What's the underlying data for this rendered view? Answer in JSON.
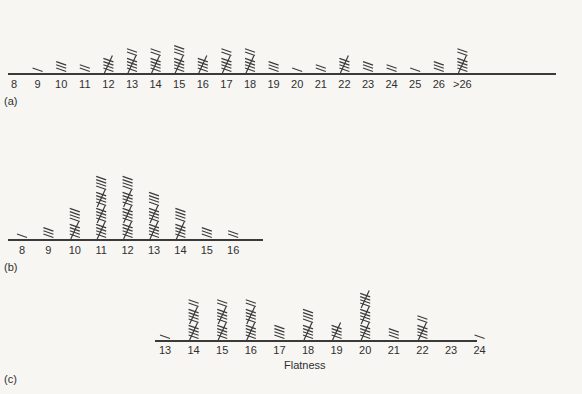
{
  "chart_data": [
    {
      "type": "bar",
      "style": "tally-marks",
      "panel_label": "(a)",
      "xlabel": "",
      "categories": [
        "8",
        "9",
        "10",
        "11",
        "12",
        "13",
        "14",
        "15",
        "16",
        "17",
        "18",
        "19",
        "20",
        "21",
        "22",
        "23",
        "24",
        "25",
        "26",
        ">26"
      ],
      "values": [
        0,
        1,
        3,
        2,
        5,
        7,
        7,
        8,
        5,
        7,
        7,
        3,
        1,
        2,
        5,
        3,
        2,
        1,
        3,
        7
      ],
      "grid": false
    },
    {
      "type": "bar",
      "style": "tally-marks",
      "panel_label": "(b)",
      "xlabel": "",
      "categories": [
        "8",
        "9",
        "10",
        "11",
        "12",
        "13",
        "14",
        "15",
        "16"
      ],
      "values": [
        1,
        3,
        9,
        19,
        19,
        14,
        9,
        3,
        2
      ],
      "grid": false
    },
    {
      "type": "bar",
      "style": "tally-marks",
      "panel_label": "(c)",
      "xlabel": "Flatness",
      "categories": [
        "13",
        "14",
        "15",
        "16",
        "17",
        "18",
        "19",
        "20",
        "21",
        "22",
        "23",
        "24"
      ],
      "values": [
        1,
        12,
        12,
        12,
        4,
        9,
        5,
        15,
        3,
        7,
        0,
        1
      ],
      "grid": false
    }
  ],
  "layout": {
    "panels": [
      {
        "axis_y": 74,
        "x0": 8,
        "x1": 556,
        "first_x": 14,
        "step": 23.6,
        "label_y": 78,
        "panel_label_pos": [
          4,
          95
        ]
      },
      {
        "axis_y": 240,
        "x0": 8,
        "x1": 263,
        "first_x": 22,
        "step": 26.4,
        "label_y": 244,
        "panel_label_pos": [
          4,
          261
        ]
      },
      {
        "axis_y": 341,
        "x0": 155,
        "x1": 477,
        "first_x": 165,
        "step": 28.6,
        "label_y": 344,
        "panel_label_pos": [
          4,
          373
        ],
        "xlabel_pos": [
          283,
          360
        ]
      }
    ],
    "ink_color": "#3a3a3a"
  }
}
